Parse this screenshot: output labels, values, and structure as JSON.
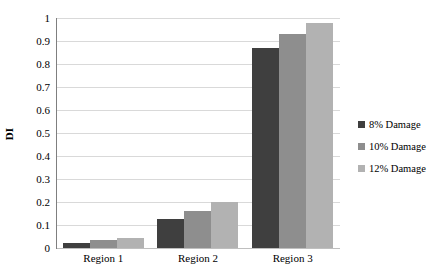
{
  "chart_data": {
    "type": "bar",
    "title": "",
    "subtitle": "",
    "xlabel": "",
    "ylabel": "DI",
    "categories": [
      "Region 1",
      "Region 2",
      "Region 3"
    ],
    "series": [
      {
        "name": "8% Damage",
        "color": "#3f3f3f",
        "values": [
          0.02,
          0.125,
          0.87
        ]
      },
      {
        "name": "10% Damage",
        "color": "#8e8e8e",
        "values": [
          0.035,
          0.16,
          0.93
        ]
      },
      {
        "name": "12% Damage",
        "color": "#b2b2b2",
        "values": [
          0.045,
          0.2,
          0.98
        ]
      }
    ],
    "ylim": [
      0,
      1
    ],
    "y_ticks": [
      0,
      0.1,
      0.2,
      0.3,
      0.4,
      0.5,
      0.6,
      0.7,
      0.8,
      0.9,
      1
    ],
    "y_tick_labels": [
      "0",
      "0.1",
      "0.2",
      "0.3",
      "0.4",
      "0.5",
      "0.6",
      "0.7",
      "0.8",
      "0.9",
      "1"
    ],
    "grid": true,
    "grid_axis": "y",
    "legend_position": "right",
    "background_color": "#ffffff",
    "gridline_color": "#d9d9d9",
    "axis_color": "#7f7f7f"
  }
}
